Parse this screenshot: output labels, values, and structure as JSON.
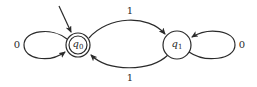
{
  "diagram": {
    "type": "finite-state-automaton",
    "colors": {
      "stroke": "#2a2a2a",
      "background": "#ffffff"
    },
    "states": [
      {
        "id": "q0",
        "name": "q",
        "subscript": "0",
        "initial": true,
        "accepting": true
      },
      {
        "id": "q1",
        "name": "q",
        "subscript": "1",
        "initial": false,
        "accepting": false
      }
    ],
    "transitions": [
      {
        "from": "q0",
        "to": "q0",
        "label": "0"
      },
      {
        "from": "q0",
        "to": "q1",
        "label": "1"
      },
      {
        "from": "q1",
        "to": "q0",
        "label": "1"
      },
      {
        "from": "q1",
        "to": "q1",
        "label": "0"
      }
    ]
  }
}
